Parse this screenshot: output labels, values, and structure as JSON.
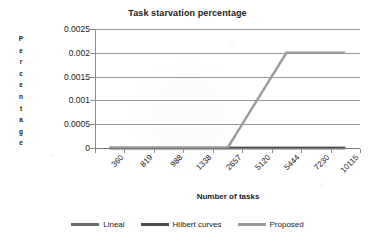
{
  "chart_data": {
    "type": "line",
    "title": "Task starvation percentage",
    "xlabel": "Number of tasks",
    "ylabel": "Percentage",
    "categories": [
      "360",
      "819",
      "988",
      "1338",
      "2657",
      "5120",
      "5444",
      "7230",
      "10115"
    ],
    "ylim": [
      0,
      0.0025
    ],
    "y_ticks": [
      "0",
      "0.0005",
      "0.001",
      "0.0015",
      "0.002",
      "0.0025"
    ],
    "y_tick_values": [
      0,
      0.0005,
      0.001,
      0.0015,
      0.002,
      0.0025
    ],
    "grid": true,
    "legend_position": "bottom",
    "series": [
      {
        "name": "Lineal",
        "color": "#6b6b6b",
        "values": [
          0,
          0,
          0,
          0,
          0,
          0,
          0,
          0,
          0
        ]
      },
      {
        "name": "Hilbert curves",
        "color": "#4d4d4d",
        "values": [
          0,
          0,
          0,
          0,
          0,
          0,
          0,
          0,
          0
        ]
      },
      {
        "name": "Proposed",
        "color": "#9b9b9b",
        "values": [
          0,
          0,
          0,
          0,
          0,
          0.001,
          0.002,
          0.002,
          0.002
        ]
      }
    ]
  },
  "legend": {
    "items": [
      {
        "label": "Lineal",
        "color": "#6b6b6b"
      },
      {
        "label": "Hilbert curves",
        "color": "#4d4d4d"
      },
      {
        "label": "Proposed",
        "color": "#9b9b9b"
      }
    ]
  },
  "axis_title_letters": {
    "y": [
      "P",
      "e",
      "r",
      "c",
      "e",
      "n",
      "t",
      "a",
      "g",
      "e"
    ]
  }
}
